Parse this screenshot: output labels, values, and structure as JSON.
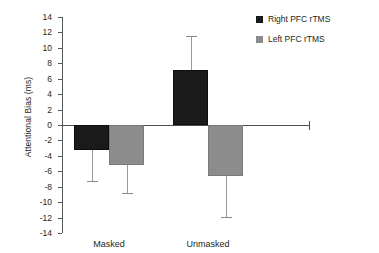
{
  "chart_data": {
    "type": "bar",
    "title": "",
    "xlabel": "",
    "ylabel": "Attentional Bias (ms)",
    "categories": [
      "Masked",
      "Unmasked"
    ],
    "ylim": [
      -14,
      14
    ],
    "yticks": [
      14,
      12,
      10,
      8,
      6,
      4,
      2,
      0,
      -2,
      -4,
      -6,
      -8,
      -10,
      -12,
      -14
    ],
    "ytick_labels": [
      "14",
      "12",
      "10",
      "8",
      "6",
      "4",
      "2",
      "0",
      "-2",
      "-4",
      "-6",
      "-8",
      "-10",
      "-12",
      "-14"
    ],
    "grid": false,
    "legend_position": "top-right",
    "series": [
      {
        "name": "Right PFC rTMS",
        "color": "#1a1a1a",
        "values": [
          -3.3,
          7.1
        ],
        "error_low": [
          -7.2,
          2.7
        ],
        "error_high": [
          -3.3,
          11.5
        ]
      },
      {
        "name": "Left PFC rTMS",
        "color": "#8c8c8c",
        "values": [
          -5.2,
          -6.6
        ],
        "error_low": [
          -8.8,
          -11.9
        ],
        "error_high": [
          -5.2,
          -6.6
        ]
      }
    ]
  },
  "legend": {
    "items": [
      {
        "label": "Right PFC rTMS",
        "swatch": "dark"
      },
      {
        "label": "Left PFC rTMS",
        "swatch": "grey"
      }
    ]
  },
  "axis": {
    "y_title": "Attentional Bias (ms)"
  }
}
